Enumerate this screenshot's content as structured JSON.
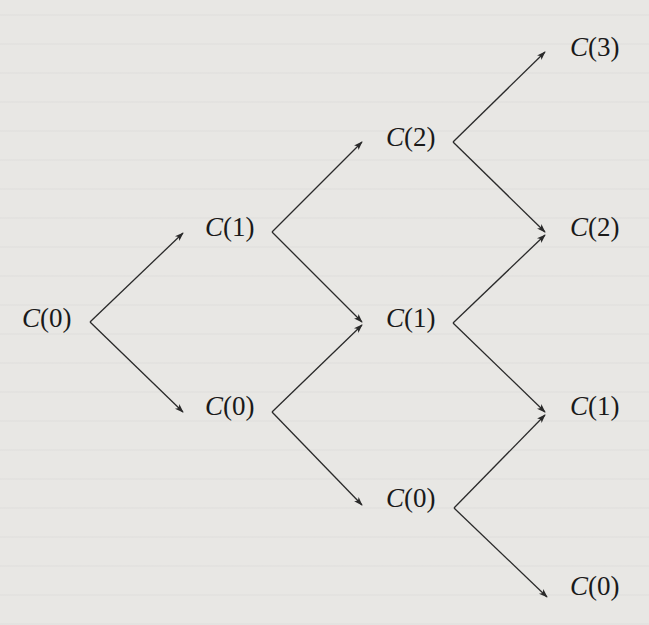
{
  "diagram": {
    "type": "binomial-tree",
    "steps": 3,
    "line_color": "#2a2a2a",
    "nodes": [
      {
        "id": "n00",
        "label": "C(0)",
        "fn": "C",
        "arg": "0",
        "step": 0,
        "x": 22,
        "y": 305
      },
      {
        "id": "n11",
        "label": "C(1)",
        "fn": "C",
        "arg": "1",
        "step": 1,
        "x": 205,
        "y": 214
      },
      {
        "id": "n10",
        "label": "C(0)",
        "fn": "C",
        "arg": "0",
        "step": 1,
        "x": 205,
        "y": 393
      },
      {
        "id": "n22",
        "label": "C(2)",
        "fn": "C",
        "arg": "2",
        "step": 2,
        "x": 386,
        "y": 124
      },
      {
        "id": "n21",
        "label": "C(1)",
        "fn": "C",
        "arg": "1",
        "step": 2,
        "x": 386,
        "y": 305
      },
      {
        "id": "n20",
        "label": "C(0)",
        "fn": "C",
        "arg": "0",
        "step": 2,
        "x": 386,
        "y": 485
      },
      {
        "id": "n33",
        "label": "C(3)",
        "fn": "C",
        "arg": "3",
        "step": 3,
        "x": 570,
        "y": 34
      },
      {
        "id": "n32",
        "label": "C(2)",
        "fn": "C",
        "arg": "2",
        "step": 3,
        "x": 570,
        "y": 214
      },
      {
        "id": "n31",
        "label": "C(1)",
        "fn": "C",
        "arg": "1",
        "step": 3,
        "x": 570,
        "y": 393
      },
      {
        "id": "n30",
        "label": "C(0)",
        "fn": "C",
        "arg": "0",
        "step": 3,
        "x": 570,
        "y": 573
      }
    ],
    "edges": [
      {
        "from": "n00",
        "to": "n11",
        "x1": 90,
        "y1": 322,
        "x2": 183,
        "y2": 233
      },
      {
        "from": "n00",
        "to": "n10",
        "x1": 90,
        "y1": 322,
        "x2": 183,
        "y2": 412
      },
      {
        "from": "n11",
        "to": "n22",
        "x1": 272,
        "y1": 232,
        "x2": 362,
        "y2": 142
      },
      {
        "from": "n11",
        "to": "n21",
        "x1": 272,
        "y1": 232,
        "x2": 362,
        "y2": 322
      },
      {
        "from": "n10",
        "to": "n21",
        "x1": 272,
        "y1": 412,
        "x2": 362,
        "y2": 325
      },
      {
        "from": "n10",
        "to": "n20",
        "x1": 272,
        "y1": 412,
        "x2": 362,
        "y2": 505
      },
      {
        "from": "n22",
        "to": "n33",
        "x1": 453,
        "y1": 142,
        "x2": 545,
        "y2": 52
      },
      {
        "from": "n22",
        "to": "n32",
        "x1": 453,
        "y1": 142,
        "x2": 545,
        "y2": 232
      },
      {
        "from": "n21",
        "to": "n32",
        "x1": 453,
        "y1": 323,
        "x2": 545,
        "y2": 235
      },
      {
        "from": "n21",
        "to": "n31",
        "x1": 453,
        "y1": 323,
        "x2": 545,
        "y2": 412
      },
      {
        "from": "n20",
        "to": "n31",
        "x1": 454,
        "y1": 508,
        "x2": 545,
        "y2": 415
      },
      {
        "from": "n20",
        "to": "n30",
        "x1": 454,
        "y1": 508,
        "x2": 547,
        "y2": 597
      }
    ]
  }
}
